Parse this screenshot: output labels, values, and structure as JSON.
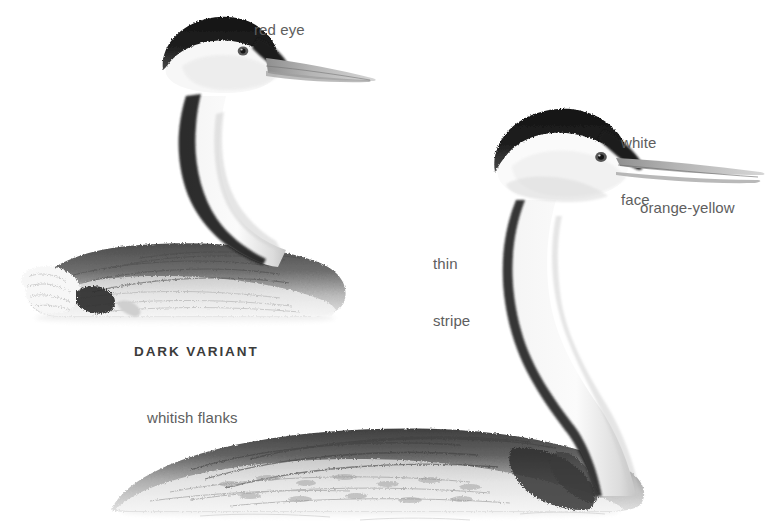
{
  "plate": {
    "title": "Grebe identification plate",
    "background_color": "#ffffff",
    "label_color": "#5e5e5e",
    "caption_color": "#3b3b3b",
    "width": 776,
    "height": 530
  },
  "labels": {
    "red_eye": "red eye",
    "white_face_line1": "white",
    "white_face_line2": "face",
    "orange_yellow": "orange-yellow",
    "thin_stripe_line1": "thin",
    "thin_stripe_line2": "stripe",
    "whitish_flanks": "whitish flanks",
    "dark_variant": "DARK VARIANT"
  },
  "figures": [
    {
      "name": "dark-variant-grebe",
      "caption": "DARK VARIANT",
      "annotations": [
        "red eye"
      ]
    },
    {
      "name": "main-grebe",
      "annotations": [
        "white face",
        "orange-yellow",
        "thin stripe",
        "whitish flanks"
      ]
    }
  ]
}
